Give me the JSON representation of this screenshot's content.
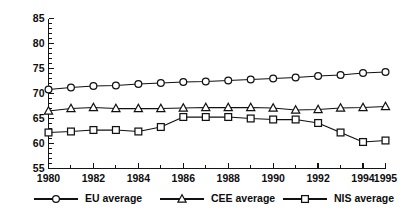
{
  "chart_data": {
    "type": "line",
    "title": "",
    "xlabel": "",
    "ylabel": "",
    "xlim": [
      1980,
      1995
    ],
    "ylim": [
      55,
      85
    ],
    "grid": false,
    "legend_position": "bottom",
    "x": [
      1980,
      1981,
      1982,
      1983,
      1984,
      1985,
      1986,
      1987,
      1988,
      1989,
      1990,
      1991,
      1992,
      1993,
      1994,
      1995
    ],
    "x_tick_labels": [
      "1980",
      "1982",
      "1984",
      "1986",
      "1988",
      "1990",
      "1992",
      "1994",
      "1995"
    ],
    "x_tick_values": [
      1980,
      1982,
      1984,
      1986,
      1988,
      1990,
      1992,
      1994,
      1995
    ],
    "y_tick_labels": [
      "55",
      "60",
      "65",
      "70",
      "75",
      "80",
      "85"
    ],
    "y_tick_values": [
      55,
      60,
      65,
      70,
      75,
      80,
      85
    ],
    "y_minor_step": 1,
    "series": [
      {
        "name": "EU average",
        "marker": "circle",
        "values": [
          70.8,
          71.2,
          71.5,
          71.6,
          71.9,
          72.1,
          72.3,
          72.4,
          72.6,
          72.8,
          73.0,
          73.2,
          73.5,
          73.7,
          74.1,
          74.3
        ]
      },
      {
        "name": "CEE average",
        "marker": "triangle",
        "values": [
          66.5,
          67.0,
          67.2,
          67.0,
          67.0,
          67.0,
          67.1,
          67.2,
          67.2,
          67.2,
          67.1,
          66.7,
          66.8,
          67.1,
          67.2,
          67.4
        ]
      },
      {
        "name": "NIS average",
        "marker": "square",
        "values": [
          62.2,
          62.4,
          62.7,
          62.7,
          62.4,
          63.3,
          65.3,
          65.3,
          65.3,
          65.0,
          64.8,
          64.8,
          64.1,
          62.2,
          60.3,
          60.6
        ]
      }
    ]
  },
  "legend": {
    "entries": [
      {
        "label": "EU average",
        "marker": "circle"
      },
      {
        "label": "CEE average",
        "marker": "triangle"
      },
      {
        "label": "NIS average",
        "marker": "square"
      }
    ]
  }
}
